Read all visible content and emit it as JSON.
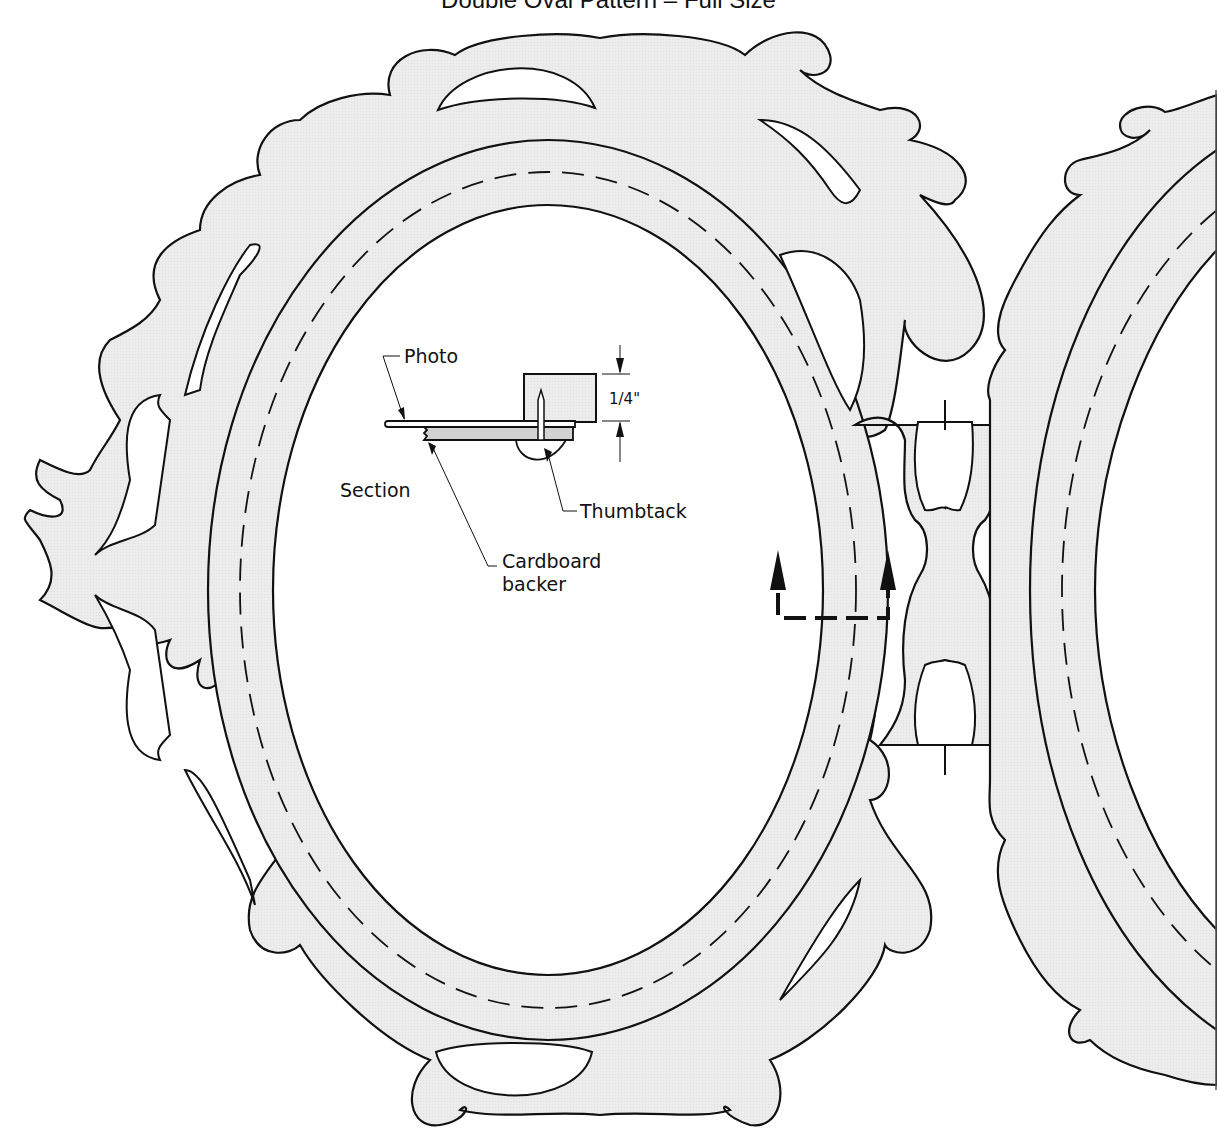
{
  "title": "Double Oval Pattern – Full Size",
  "colors": {
    "fill": "#ececec",
    "outline": "#111111",
    "background": "#ffffff",
    "section_fill": "#d2d2d2"
  },
  "section_detail": {
    "heading": "Section",
    "labels": {
      "photo": "Photo",
      "thumbtack": "Thumbtack",
      "cardboard_line1": "Cardboard",
      "cardboard_line2": "backer"
    },
    "dimension": "1/4\""
  },
  "section_marker": {
    "type": "cut-line-with-arrows",
    "direction": "up"
  },
  "frames": [
    {
      "name": "left-oval-frame",
      "visible": "full"
    },
    {
      "name": "right-oval-frame",
      "visible": "partial (cropped at right edge)"
    }
  ],
  "connector": {
    "name": "center-connector-bridge"
  },
  "guides": {
    "dashed_centerline": true
  }
}
